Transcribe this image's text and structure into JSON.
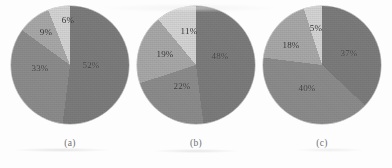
{
  "figure": {
    "background_color": "#fdfdfd",
    "palette": {
      "dark": "#7c7c7c",
      "dark_medium": "#8c8c8c",
      "medium": "#a8a8a8",
      "light": "#d4d4d4",
      "outline": "#787880",
      "label_dark": "#3a3a3a",
      "label_light": "#2e2e2e"
    }
  },
  "chart_data": [
    {
      "type": "pie",
      "title": "",
      "caption": "(a)",
      "labels": [
        "52%",
        "33%",
        "9%",
        "6%"
      ],
      "values": [
        52,
        33,
        9,
        6
      ],
      "colors": [
        "#7c7c7c",
        "#8c8c8c",
        "#a8a8a8",
        "#d4d4d4"
      ],
      "start_angle": 0,
      "direction": "clockwise",
      "legend": "none",
      "label_positions": [
        {
          "text": "52%",
          "x": 80,
          "y": 59,
          "color": "#3f3f3f"
        },
        {
          "text": "33%",
          "x": 29,
          "y": 62,
          "color": "#3a3a3a"
        },
        {
          "text": "9%",
          "x": 35,
          "y": 26,
          "color": "#2e2e2e"
        },
        {
          "text": "6%",
          "x": 57,
          "y": 14,
          "color": "#2e2e2e"
        }
      ]
    },
    {
      "type": "pie",
      "title": "",
      "caption": "(b)",
      "labels": [
        "48%",
        "22%",
        "19%",
        "11%"
      ],
      "values": [
        48,
        22,
        19,
        11
      ],
      "colors": [
        "#7c7c7c",
        "#8c8c8c",
        "#a8a8a8",
        "#d4d4d4"
      ],
      "start_angle": 0,
      "direction": "clockwise",
      "legend": "none",
      "label_positions": [
        {
          "text": "48%",
          "x": 83,
          "y": 50,
          "color": "#3f3f3f"
        },
        {
          "text": "22%",
          "x": 45,
          "y": 80,
          "color": "#3a3a3a"
        },
        {
          "text": "19%",
          "x": 28,
          "y": 48,
          "color": "#2e2e2e"
        },
        {
          "text": "11%",
          "x": 52,
          "y": 25,
          "color": "#2e2e2e"
        }
      ]
    },
    {
      "type": "pie",
      "title": "",
      "caption": "(c)",
      "labels": [
        "37%",
        "40%",
        "18%",
        "5%"
      ],
      "values": [
        37,
        40,
        18,
        5
      ],
      "colors": [
        "#7c7c7c",
        "#8c8c8c",
        "#a8a8a8",
        "#d4d4d4"
      ],
      "start_angle": 0,
      "direction": "clockwise",
      "legend": "none",
      "label_positions": [
        {
          "text": "37%",
          "x": 86,
          "y": 47,
          "color": "#3f3f3f"
        },
        {
          "text": "40%",
          "x": 44,
          "y": 82,
          "color": "#3a3a3a"
        },
        {
          "text": "18%",
          "x": 28,
          "y": 39,
          "color": "#2e2e2e"
        },
        {
          "text": "5%",
          "x": 53,
          "y": 22,
          "color": "#2e2e2e"
        }
      ]
    }
  ]
}
